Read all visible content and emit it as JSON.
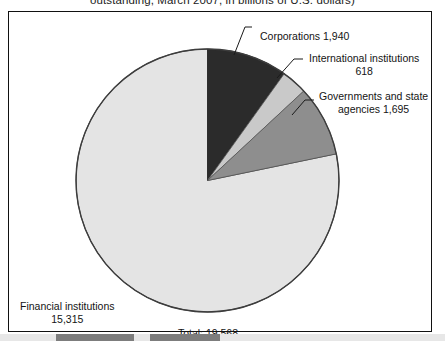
{
  "title": "outstanding, March 2007, in billions of U.S. dollars)",
  "total_label": "Total: 19,568",
  "labels": {
    "corporations": {
      "name": "Corporations 1,940"
    },
    "international": {
      "name": "International institutions",
      "value": "618"
    },
    "governments": {
      "name": "Governments and state",
      "value": "agencies 1,695"
    },
    "financial": {
      "name": "Financial institutions",
      "value": "15,315"
    }
  },
  "chart_data": {
    "type": "pie",
    "title": "outstanding, March 2007, in billions of U.S. dollars)",
    "unit": "billions of U.S. dollars",
    "total": 19568,
    "start_angle_deg": 0,
    "direction": "clockwise",
    "legend_position": "callout-labels",
    "grid": false,
    "categories": [
      "Corporations",
      "International institutions",
      "Governments and state agencies",
      "Financial institutions"
    ],
    "values": [
      1940,
      618,
      1695,
      15315
    ],
    "percentages": [
      9.9,
      3.2,
      8.7,
      78.3
    ],
    "colors": [
      "#2b2b2b",
      "#c9c9c9",
      "#8e8e8e",
      "#e4e4e4"
    ],
    "slices": [
      {
        "label": "Corporations",
        "value": 1940,
        "display": "1,940",
        "percent": 9.9,
        "color": "#2b2b2b",
        "start_deg": 0.0,
        "end_deg": 35.7
      },
      {
        "label": "International institutions",
        "value": 618,
        "display": "618",
        "percent": 3.2,
        "color": "#c9c9c9",
        "start_deg": 35.7,
        "end_deg": 47.1
      },
      {
        "label": "Governments and state agencies",
        "value": 1695,
        "display": "1,695",
        "percent": 8.7,
        "color": "#8e8e8e",
        "start_deg": 47.1,
        "end_deg": 78.3
      },
      {
        "label": "Financial institutions",
        "value": 15315,
        "display": "15,315",
        "percent": 78.3,
        "color": "#e4e4e4",
        "start_deg": 78.3,
        "end_deg": 360.0
      }
    ]
  },
  "style": {
    "frame_color": "#111111",
    "text_color": "#141414",
    "background": "#ffffff"
  }
}
